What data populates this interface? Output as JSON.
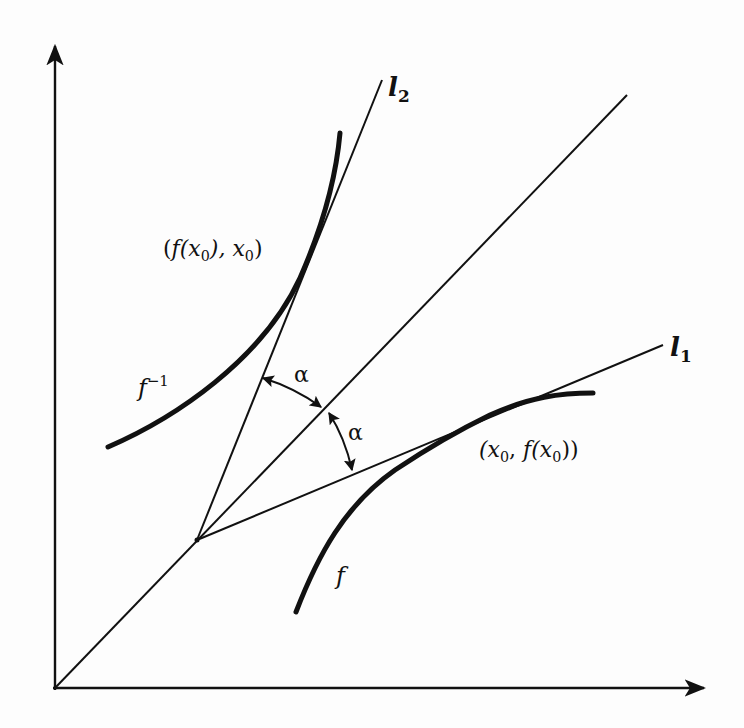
{
  "diagram": {
    "title": "",
    "colors": {
      "ink": "#111111",
      "background": "#fdfdfd"
    },
    "axes": {
      "x_axis": "horizontal-arrow",
      "y_axis": "vertical-arrow"
    },
    "lines": {
      "diagonal": "y = x",
      "l2": {
        "name": "l",
        "subscript": "2"
      },
      "l1": {
        "name": "l",
        "subscript": "1"
      }
    },
    "curves": {
      "f_inverse": {
        "name": "f",
        "superscript": "−1"
      },
      "f": {
        "name": "f"
      }
    },
    "points": {
      "inverse_point": {
        "open": "(",
        "f": "f",
        "fx_open": "(x",
        "sub0a": "0",
        "mid": "), x",
        "sub0b": "0",
        "close": ")"
      },
      "function_point": {
        "open": "(x",
        "sub0a": "0",
        "mid": ", ",
        "f": "f",
        "fx_open": "(x",
        "sub0b": "0",
        "close": "))"
      }
    },
    "angles": {
      "upper": "α",
      "lower": "α"
    }
  }
}
